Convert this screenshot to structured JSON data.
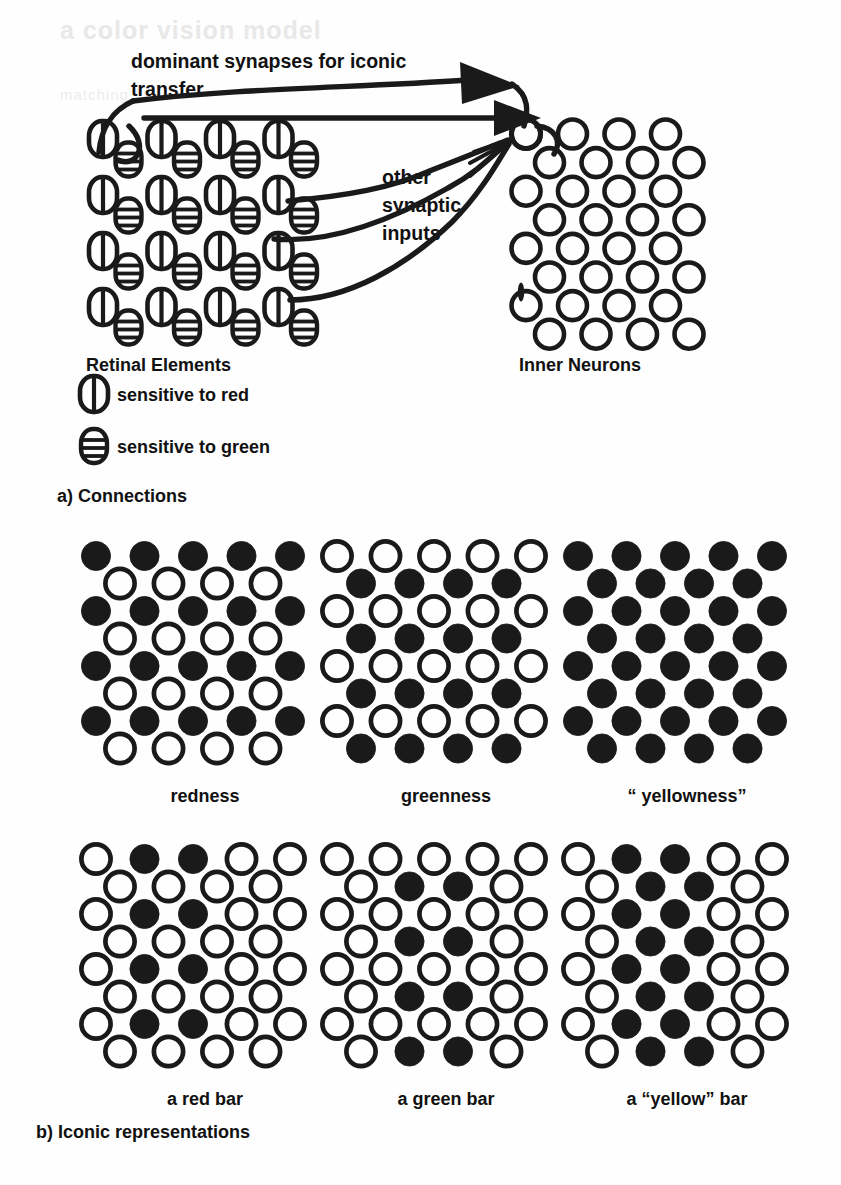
{
  "figure": {
    "bleed_text_top": "a color vision model",
    "bleed_text_sub": "matching"
  },
  "panel_a": {
    "caption": "a) Connections",
    "annotations": {
      "dominant_line1": "dominant synapses for iconic",
      "dominant_line2": "transfer",
      "other_line1": "other",
      "other_line2": "synaptic",
      "other_line3": "inputs"
    },
    "labels": {
      "retinal": "Retinal Elements",
      "inner": "Inner Neurons"
    },
    "legend": [
      {
        "key": "red",
        "label": "sensitive to red",
        "glyph": "vertical-split-capsule"
      },
      {
        "key": "green",
        "label": "sensitive to green",
        "glyph": "horizontal-striped-capsule"
      }
    ],
    "retina_grid": {
      "rows": 4,
      "cols": 4,
      "pair": [
        "red-element",
        "green-element"
      ]
    },
    "inner_grid": {
      "rows": 8,
      "cols_per_row": [
        4,
        4,
        4,
        4,
        4,
        4,
        4,
        4
      ],
      "state": "open"
    }
  },
  "panel_b": {
    "caption": "b) Iconic representations",
    "cells": [
      {
        "label": "redness",
        "name": "redness",
        "rows": [
          {
            "type": "red",
            "fill": [
              1,
              1,
              1,
              1,
              1
            ]
          },
          {
            "type": "green",
            "fill": [
              0,
              0,
              0,
              0
            ]
          },
          {
            "type": "red",
            "fill": [
              1,
              1,
              1,
              1,
              1
            ]
          },
          {
            "type": "green",
            "fill": [
              0,
              0,
              0,
              0
            ]
          },
          {
            "type": "red",
            "fill": [
              1,
              1,
              1,
              1,
              1
            ]
          },
          {
            "type": "green",
            "fill": [
              0,
              0,
              0,
              0
            ]
          },
          {
            "type": "red",
            "fill": [
              1,
              1,
              1,
              1,
              1
            ]
          },
          {
            "type": "green",
            "fill": [
              0,
              0,
              0,
              0
            ]
          }
        ]
      },
      {
        "label": "greenness",
        "name": "greenness",
        "rows": [
          {
            "type": "red",
            "fill": [
              0,
              0,
              0,
              0,
              0
            ]
          },
          {
            "type": "green",
            "fill": [
              1,
              1,
              1,
              1
            ]
          },
          {
            "type": "red",
            "fill": [
              0,
              0,
              0,
              0,
              0
            ]
          },
          {
            "type": "green",
            "fill": [
              1,
              1,
              1,
              1
            ]
          },
          {
            "type": "red",
            "fill": [
              0,
              0,
              0,
              0,
              0
            ]
          },
          {
            "type": "green",
            "fill": [
              1,
              1,
              1,
              1
            ]
          },
          {
            "type": "red",
            "fill": [
              0,
              0,
              0,
              0,
              0
            ]
          },
          {
            "type": "green",
            "fill": [
              1,
              1,
              1,
              1
            ]
          }
        ]
      },
      {
        "label": "“ yellowness”",
        "name": "yellowness",
        "rows": [
          {
            "type": "red",
            "fill": [
              1,
              1,
              1,
              1,
              1
            ]
          },
          {
            "type": "green",
            "fill": [
              1,
              1,
              1,
              1
            ]
          },
          {
            "type": "red",
            "fill": [
              1,
              1,
              1,
              1,
              1
            ]
          },
          {
            "type": "green",
            "fill": [
              1,
              1,
              1,
              1
            ]
          },
          {
            "type": "red",
            "fill": [
              1,
              1,
              1,
              1,
              1
            ]
          },
          {
            "type": "green",
            "fill": [
              1,
              1,
              1,
              1
            ]
          },
          {
            "type": "red",
            "fill": [
              1,
              1,
              1,
              1,
              1
            ]
          },
          {
            "type": "green",
            "fill": [
              1,
              1,
              1,
              1
            ]
          }
        ]
      },
      {
        "label": "a red bar",
        "name": "red-bar",
        "rows": [
          {
            "type": "red",
            "fill": [
              0,
              1,
              1,
              0,
              0
            ]
          },
          {
            "type": "green",
            "fill": [
              0,
              0,
              0,
              0
            ]
          },
          {
            "type": "red",
            "fill": [
              0,
              1,
              1,
              0,
              0
            ]
          },
          {
            "type": "green",
            "fill": [
              0,
              0,
              0,
              0
            ]
          },
          {
            "type": "red",
            "fill": [
              0,
              1,
              1,
              0,
              0
            ]
          },
          {
            "type": "green",
            "fill": [
              0,
              0,
              0,
              0
            ]
          },
          {
            "type": "red",
            "fill": [
              0,
              1,
              1,
              0,
              0
            ]
          },
          {
            "type": "green",
            "fill": [
              0,
              0,
              0,
              0
            ]
          }
        ]
      },
      {
        "label": "a green bar",
        "name": "green-bar",
        "rows": [
          {
            "type": "red",
            "fill": [
              0,
              0,
              0,
              0,
              0
            ]
          },
          {
            "type": "green",
            "fill": [
              0,
              1,
              1,
              0
            ]
          },
          {
            "type": "red",
            "fill": [
              0,
              0,
              0,
              0,
              0
            ]
          },
          {
            "type": "green",
            "fill": [
              0,
              1,
              1,
              0
            ]
          },
          {
            "type": "red",
            "fill": [
              0,
              0,
              0,
              0,
              0
            ]
          },
          {
            "type": "green",
            "fill": [
              0,
              1,
              1,
              0
            ]
          },
          {
            "type": "red",
            "fill": [
              0,
              0,
              0,
              0,
              0
            ]
          },
          {
            "type": "green",
            "fill": [
              0,
              1,
              1,
              0
            ]
          }
        ]
      },
      {
        "label": "a “yellow” bar",
        "name": "yellow-bar",
        "rows": [
          {
            "type": "red",
            "fill": [
              0,
              1,
              1,
              0,
              0
            ]
          },
          {
            "type": "green",
            "fill": [
              0,
              1,
              1,
              0
            ]
          },
          {
            "type": "red",
            "fill": [
              0,
              1,
              1,
              0,
              0
            ]
          },
          {
            "type": "green",
            "fill": [
              0,
              1,
              1,
              0
            ]
          },
          {
            "type": "red",
            "fill": [
              0,
              1,
              1,
              0,
              0
            ]
          },
          {
            "type": "green",
            "fill": [
              0,
              1,
              1,
              0
            ]
          },
          {
            "type": "red",
            "fill": [
              0,
              1,
              1,
              0,
              0
            ]
          },
          {
            "type": "green",
            "fill": [
              0,
              1,
              1,
              0
            ]
          }
        ]
      }
    ]
  },
  "colors": {
    "ink": "#1a1a1a",
    "paper": "#fefefe",
    "bleed": "#e8e8e8"
  }
}
